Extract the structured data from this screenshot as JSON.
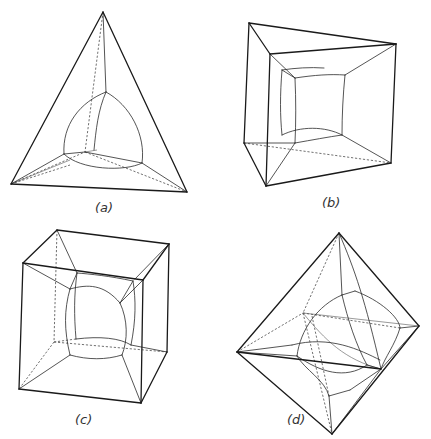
{
  "figure": {
    "panels": [
      {
        "id": "a",
        "label": "(a)",
        "shape": "tetrahedron",
        "label_pos": [
          95,
          212
        ],
        "edges": [
          "M103,12 L11,184",
          "M103,12 L187,192",
          "M11,184 L187,192"
        ],
        "thin": [
          "M103,12 L106,92",
          "M64,154 L11,184",
          "M142,163 L187,192",
          "M64,154 L85,152",
          "M85,152 L142,163",
          "M106,92 C80,102 62,125 64,154",
          "M106,92 C130,105 146,135 142,163",
          "M64,154 C80,170 125,172 142,163",
          "M106,92 C98,110 96,130 94,150"
        ],
        "faint": [
          "M85,152 L97,150",
          "M11,184 L70,160"
        ],
        "dashed": [
          "M103,12 L85,152",
          "M11,184 L85,152",
          "M85,152 L187,192",
          "M11,184 L70,165"
        ]
      },
      {
        "id": "b",
        "label": "(b)",
        "shape": "triangular-prism",
        "label_pos": [
          322,
          207
        ],
        "edges": [
          "M249,23 L396,44",
          "M249,23 L270,54",
          "M270,54 L396,44",
          "M249,23 L244,143",
          "M396,44 L391,163",
          "M270,54 L266,186",
          "M244,143 L266,186",
          "M266,186 L391,163"
        ],
        "thin": [
          "M270,54 L295,78",
          "M396,44 L345,75",
          "M295,78 C315,75 330,74 345,75",
          "M295,78 C296,100 296,122 295,143",
          "M345,75 C343,95 342,115 342,135",
          "M295,143 C312,140 328,137 342,135",
          "M295,143 L266,186",
          "M342,135 L391,163",
          "M244,143 L295,143",
          "M282,70 L295,78",
          "M282,70 C280,95 280,115 282,135",
          "M282,70 C295,68 310,67 324,68",
          "M282,135 C300,126 325,126 342,135"
        ],
        "faint": [],
        "dashed": [
          "M244,143 L391,163"
        ]
      },
      {
        "id": "c",
        "label": "(c)",
        "shape": "cube",
        "label_pos": [
          75,
          424
        ],
        "edges": [
          "M57,230 L169,244",
          "M57,230 L23,263",
          "M169,244 L143,280",
          "M23,263 L143,280",
          "M23,263 L19,389",
          "M143,280 L141,403",
          "M169,244 L167,352",
          "M19,389 L141,403",
          "M141,403 L167,352"
        ],
        "thin": [
          "M23,263 L70,289",
          "M143,280 L120,303",
          "M57,230 L77,273",
          "M169,244 L135,279",
          "M70,289 C88,284 104,284 120,303",
          "M77,273 C90,274 110,276 133,281",
          "M70,289 C64,310 64,330 70,355",
          "M120,303 C128,320 128,340 122,355",
          "M77,273 C74,295 74,315 76,339",
          "M133,281 C136,300 136,320 131,345",
          "M70,355 C88,360 106,360 122,355",
          "M76,339 C100,336 120,338 131,345",
          "M19,389 L70,355",
          "M141,403 L122,355",
          "M167,352 L131,345",
          "M70,289 L77,273",
          "M120,303 L133,281"
        ],
        "faint": [],
        "dashed": [
          "M57,230 L54,342",
          "M54,342 L167,352",
          "M54,342 L19,389",
          "M54,342 L76,339"
        ]
      },
      {
        "id": "d",
        "label": "(d)",
        "shape": "octahedron",
        "label_pos": [
          287,
          424
        ],
        "edges": [
          "M339,233 L237,352",
          "M339,233 L419,326",
          "M237,352 L332,434",
          "M419,326 L332,434",
          "M237,352 L381,369"
        ],
        "thin": [
          "M339,233 L342,295",
          "M339,233 C355,270 365,300 381,369",
          "M342,295 L355,291",
          "M342,295 C318,305 300,330 297,356",
          "M342,295 C348,320 356,345 367,365",
          "M237,352 L292,345",
          "M237,352 L297,356",
          "M292,345 C330,335 360,350 380,360",
          "M297,356 C320,372 345,380 367,365",
          "M381,369 L419,326",
          "M381,369 L367,365",
          "M332,434 L329,396",
          "M329,396 L350,390",
          "M329,396 C325,380 305,370 297,356",
          "M350,390 L381,369",
          "M332,434 L381,369",
          "M355,291 C380,300 400,318 400,328",
          "M400,328 L419,326",
          "M400,328 C395,345 385,357 381,369"
        ],
        "faint": [
          "M303,313 L419,326",
          "M303,313 C325,340 345,360 381,369"
        ],
        "dashed": [
          "M339,233 L303,313",
          "M237,352 L303,313",
          "M303,313 L332,434",
          "M303,313 L400,328",
          "M312,316 L329,396"
        ]
      }
    ]
  }
}
